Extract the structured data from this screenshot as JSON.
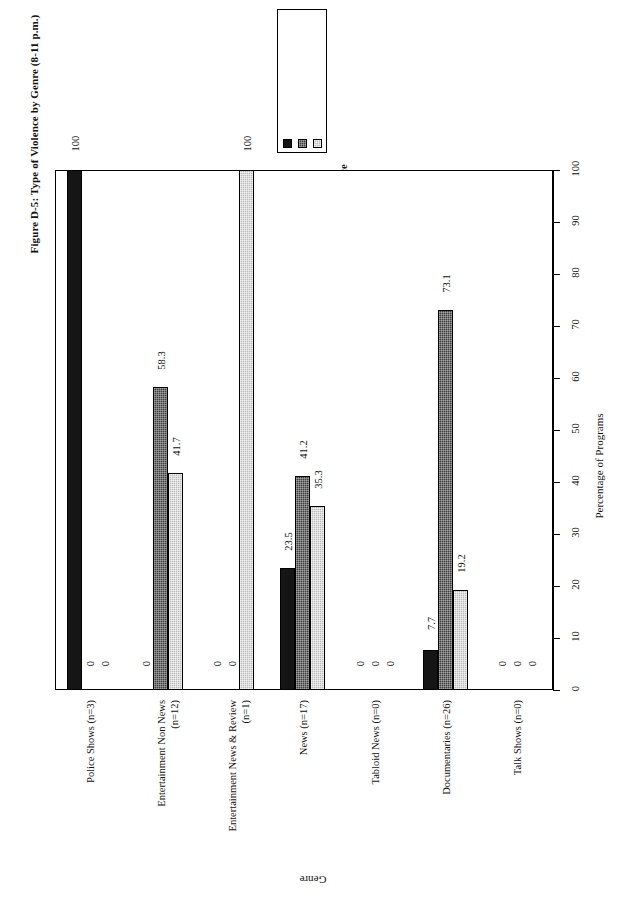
{
  "figure": {
    "title": "Figure D-5: Type of Violence by Genre (8-11 p.m.)"
  },
  "axes": {
    "value_axis_title": "Percentage of Programs",
    "category_axis_title": "Genre"
  },
  "legend": {
    "items": [
      {
        "label": "Talk About Violence",
        "swatch": "solid-black"
      },
      {
        "label": "Visual Violence",
        "swatch": "dark-gray-dotted"
      },
      {
        "label": "No Violence",
        "swatch": "light-gray-dotted"
      }
    ]
  },
  "chart_data": {
    "type": "bar",
    "title": "Figure D-5: Type of Violence by Genre (8-11 p.m.)",
    "xlabel": "Genre",
    "ylabel": "Percentage of Programs",
    "ylim": [
      0,
      100
    ],
    "yticks": [
      0,
      10,
      20,
      30,
      40,
      50,
      60,
      70,
      80,
      90,
      100
    ],
    "grid": false,
    "legend_position": "top-center",
    "orientation": "vertical",
    "categories": [
      "Police Shows (n=3)",
      "Entertainment Non News (n=12)",
      "Entertainment News & Review (n=1)",
      "News (n=17)",
      "Tabloid News (n=0)",
      "Documentaries (n=26)",
      "Talk Shows (n=0)"
    ],
    "category_lines": [
      [
        "Police Shows (n=3)"
      ],
      [
        "Entertainment Non News",
        "(n=12)"
      ],
      [
        "Entertainment News & Review",
        "(n=1)"
      ],
      [
        "News (n=17)"
      ],
      [
        "Tabloid News (n=0)"
      ],
      [
        "Documentaries (n=26)"
      ],
      [
        "Talk Shows (n=0)"
      ]
    ],
    "series": [
      {
        "name": "Talk About Violence",
        "values": [
          100,
          0,
          0,
          23.5,
          0,
          7.7,
          0
        ]
      },
      {
        "name": "Visual Violence",
        "values": [
          0,
          58.3,
          0,
          41.2,
          0,
          73.1,
          0
        ]
      },
      {
        "name": "No Violence",
        "values": [
          0,
          41.7,
          100,
          35.3,
          0,
          19.2,
          0
        ]
      }
    ],
    "data_labels": [
      [
        "100",
        "0",
        "0"
      ],
      [
        "0",
        "58.3",
        "41.7"
      ],
      [
        "0",
        "0",
        "100"
      ],
      [
        "23.5",
        "41.2",
        "35.3"
      ],
      [
        "0",
        "0",
        "0"
      ],
      [
        "7.7",
        "73.1",
        "19.2"
      ],
      [
        "0",
        "0",
        "0"
      ]
    ]
  }
}
